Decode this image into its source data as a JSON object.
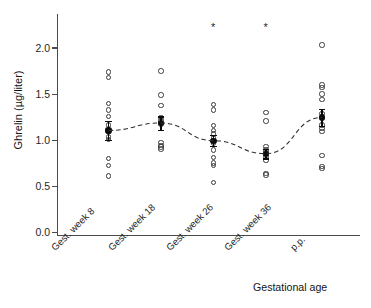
{
  "chart_data": {
    "type": "scatter",
    "title": "",
    "subtitle": "",
    "xlabel": "Gestational age",
    "ylabel": "Ghrelin (µg/liter)",
    "categories": [
      "Gest. week 8",
      "Gest. week 18",
      "Gest. week 26",
      "Gest. week 36",
      "p.p."
    ],
    "ylim": [
      0.0,
      2.35
    ],
    "yticks": [
      0.0,
      0.5,
      1.0,
      1.5,
      2.0
    ],
    "ytick_labels": [
      "0.0",
      "0.5",
      "1.0",
      "1.5",
      "2.0"
    ],
    "grid": false,
    "legend": "none",
    "series": [
      {
        "name": "Individual subjects",
        "marker": "open-circle",
        "groups": [
          {
            "category": "Gest. week 8",
            "values": [
              1.75,
              1.69,
              1.41,
              1.34,
              1.27,
              1.18,
              1.05,
              1.02,
              0.82,
              0.74,
              0.63
            ]
          },
          {
            "category": "Gest. week 18",
            "values": [
              1.76,
              1.5,
              1.39,
              1.26,
              1.23,
              1.19,
              0.99,
              0.96,
              0.94,
              0.92
            ]
          },
          {
            "category": "Gest. week 26",
            "values": [
              1.4,
              1.34,
              1.17,
              1.12,
              1.08,
              1.04,
              0.98,
              0.91,
              0.83,
              0.77,
              0.74,
              0.56
            ]
          },
          {
            "category": "Gest. week 36",
            "values": [
              1.31,
              1.22,
              0.95,
              0.91,
              0.88,
              0.84,
              0.8,
              0.66,
              0.64
            ]
          },
          {
            "category": "p.p.",
            "values": [
              2.04,
              1.61,
              1.58,
              1.51,
              1.45,
              1.3,
              1.18,
              1.14,
              1.11,
              0.85,
              0.73,
              0.71
            ]
          }
        ]
      },
      {
        "name": "Group mean ± SEM",
        "marker": "filled-circle",
        "line": "dashed",
        "means": [
          1.12,
          1.2,
          1.01,
          0.87,
          1.26
        ],
        "sem": [
          0.1,
          0.07,
          0.06,
          0.05,
          0.09
        ]
      }
    ],
    "annotations": [
      {
        "text": "*",
        "category": "Gest. week 26",
        "y": 2.27,
        "meaning": "significant-difference-marker"
      },
      {
        "text": "*",
        "category": "Gest. week 36",
        "y": 2.27,
        "meaning": "significant-difference-marker"
      }
    ]
  },
  "axes": {
    "y_title": "Ghrelin (µg/liter)",
    "x_title": "Gestational age",
    "y_tick_labels": [
      "2.0",
      "1.5",
      "1.0",
      "0.5",
      "0.0"
    ],
    "x_tick_labels": [
      "Gest. week 8",
      "Gest. week 18",
      "Gest. week 26",
      "Gest. week 36",
      "p.p."
    ]
  },
  "colors": {
    "axis": "#4b4b4b",
    "marker_outline": "#3a3a3a",
    "mean_marker": "#0b0b0b",
    "trend_line": "#2f2f2f",
    "background": "#ffffff",
    "text": "#1a1a1a"
  }
}
